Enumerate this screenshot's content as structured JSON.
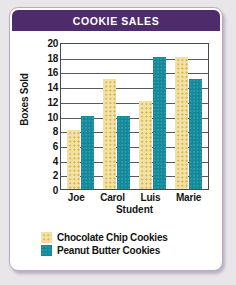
{
  "card": {
    "title": "COOKIE SALES",
    "title_bar_color": "#4e2c6b",
    "border_color": "#b8a8c4",
    "background": "#ffffff"
  },
  "chart_data": {
    "type": "bar",
    "title": "COOKIE SALES",
    "xlabel": "Student",
    "ylabel": "Boxes Sold",
    "categories": [
      "Joe",
      "Carol",
      "Luis",
      "Marie"
    ],
    "series": [
      {
        "name": "Chocolate Chip Cookies",
        "color": "#f3e2a6",
        "pattern": "dotted",
        "values": [
          8,
          15,
          12,
          18
        ]
      },
      {
        "name": "Peanut Butter Cookies",
        "color": "#11899a",
        "pattern": "solid",
        "values": [
          10,
          10,
          18,
          15
        ]
      }
    ],
    "ylim": [
      0,
      20
    ],
    "ytick_step": 2,
    "yticks": [
      20,
      18,
      16,
      14,
      12,
      10,
      8,
      6,
      4,
      2,
      0
    ],
    "grid": true,
    "grid_axis": "y",
    "legend_position": "bottom"
  },
  "legend": {
    "entries": [
      {
        "label": "Chocolate Chip Cookies",
        "swatch": "choc"
      },
      {
        "label": "Peanut Butter Cookies",
        "swatch": "peanut"
      }
    ]
  }
}
